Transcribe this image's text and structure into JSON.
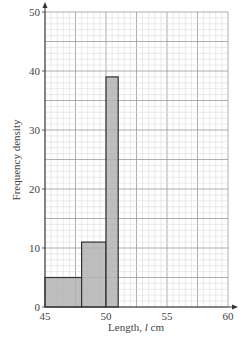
{
  "chart_data": {
    "type": "bar",
    "subtype": "histogram",
    "title": "",
    "xlabel": "Length, l cm",
    "ylabel": "Frequency density",
    "xlim": [
      45,
      60
    ],
    "ylim": [
      0,
      50
    ],
    "x_ticks": [
      45,
      50,
      55,
      60
    ],
    "y_ticks": [
      0,
      10,
      20,
      30,
      40,
      50
    ],
    "grid": true,
    "grid_minor_x": 0.5,
    "grid_minor_y": 1,
    "grid_major_x": 2.5,
    "grid_major_y": 5,
    "bins": [
      {
        "from": 45,
        "to": 48,
        "value": 5
      },
      {
        "from": 48,
        "to": 50,
        "value": 11
      },
      {
        "from": 50,
        "to": 51,
        "value": 39
      }
    ],
    "categories": [
      "45-48",
      "48-50",
      "50-51"
    ],
    "values": [
      5,
      11,
      39
    ],
    "bar_color": "#b3b3b3",
    "legend": null
  },
  "labels": {
    "xlabel_main": "Length, ",
    "xlabel_var": "l",
    "xlabel_unit": " cm",
    "ylabel": "Frequency density"
  }
}
